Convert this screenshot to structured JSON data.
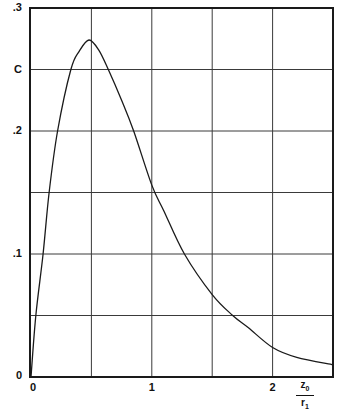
{
  "chart_data": {
    "type": "line",
    "title": "",
    "xlabel": "z0 / r1",
    "xlabel_parts": {
      "numerator": "z",
      "numerator_sub": "0",
      "denominator": "r",
      "denominator_sub": "1"
    },
    "ylabel": "",
    "xlim": [
      0,
      2.5
    ],
    "ylim": [
      0,
      0.3
    ],
    "grid": true,
    "x_gridlines": [
      0.5,
      1,
      1.5,
      2
    ],
    "y_gridlines": [
      0.05,
      0.1,
      0.15,
      0.2,
      0.25
    ],
    "x_ticks": [
      {
        "value": 0,
        "label": "0"
      },
      {
        "value": 1,
        "label": "1"
      },
      {
        "value": 2,
        "label": "2"
      }
    ],
    "y_ticks": [
      {
        "value": 0,
        "label": "0"
      },
      {
        "value": 0.1,
        "label": ".1"
      },
      {
        "value": 0.2,
        "label": ".2"
      },
      {
        "value": 0.25,
        "label": "C"
      },
      {
        "value": 0.3,
        "label": ".3"
      }
    ],
    "series": [
      {
        "name": "curve",
        "x": [
          0,
          0.04,
          0.1,
          0.15,
          0.22,
          0.33,
          0.4,
          0.48,
          0.56,
          0.64,
          0.75,
          0.85,
          1.0,
          1.1,
          1.27,
          1.5,
          1.67,
          1.8,
          2.0,
          2.2,
          2.5
        ],
        "y": [
          0,
          0.05,
          0.1,
          0.15,
          0.2,
          0.25,
          0.265,
          0.274,
          0.266,
          0.25,
          0.225,
          0.2,
          0.156,
          0.135,
          0.1,
          0.067,
          0.05,
          0.04,
          0.024,
          0.016,
          0.01
        ]
      }
    ],
    "legend": null
  },
  "colors": {
    "line": "#1a1a1a",
    "grid": "#3a3a3a",
    "background": "#ffffff"
  }
}
